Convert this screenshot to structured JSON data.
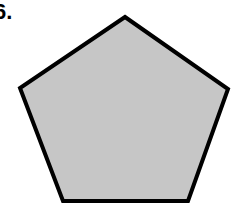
{
  "problem": {
    "number_label": "6.",
    "shape": "pentagon",
    "fill_color": "#c6c6c6",
    "stroke_color": "#000000",
    "vertices": [
      [
        125,
        17
      ],
      [
        228,
        89
      ],
      [
        188,
        201
      ],
      [
        63,
        201
      ],
      [
        20,
        88
      ]
    ]
  }
}
